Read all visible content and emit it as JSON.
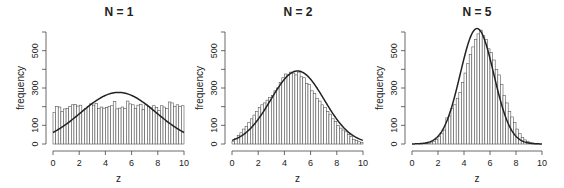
{
  "figure": {
    "ylabel": "frequency",
    "xlabel": "z",
    "colors": {
      "axis": "#444444",
      "bar_stroke": "#555555",
      "bar_fill": "#ffffff",
      "curve": "#222222"
    }
  },
  "chart_data": [
    {
      "type": "bar",
      "title": "N = 1",
      "xlabel": "z",
      "ylabel": "frequency",
      "xlim": [
        0,
        10
      ],
      "ylim": [
        0,
        600
      ],
      "xticks": [
        0,
        2,
        4,
        6,
        8,
        10
      ],
      "yticks": [
        0,
        100,
        200,
        300,
        400,
        500,
        600
      ],
      "ytick_labels": [
        "0",
        "100",
        "",
        "300",
        "",
        "500",
        ""
      ],
      "bin_width": 0.2,
      "bin_start": 0,
      "values": [
        170,
        200,
        198,
        175,
        188,
        190,
        200,
        210,
        212,
        203,
        208,
        178,
        190,
        200,
        215,
        208,
        218,
        190,
        198,
        192,
        196,
        200,
        205,
        228,
        188,
        192,
        198,
        190,
        230,
        215,
        210,
        190,
        208,
        213,
        185,
        210,
        200,
        195,
        205,
        195,
        180,
        205,
        198,
        190,
        225,
        220,
        200,
        210,
        200,
        205
      ],
      "curve": {
        "kind": "normal",
        "mean": 5,
        "sd": 2.887,
        "n": 10000
      },
      "grid": false,
      "legend": null
    },
    {
      "type": "bar",
      "title": "N = 2",
      "xlabel": "z",
      "ylabel": "frequency",
      "xlim": [
        0,
        10
      ],
      "ylim": [
        0,
        600
      ],
      "xticks": [
        0,
        2,
        4,
        6,
        8,
        10
      ],
      "yticks": [
        0,
        100,
        200,
        300,
        400,
        500,
        600
      ],
      "ytick_labels": [
        "0",
        "100",
        "",
        "300",
        "",
        "500",
        ""
      ],
      "bin_width": 0.2,
      "bin_start": 0,
      "values": [
        15,
        30,
        45,
        60,
        80,
        95,
        115,
        135,
        155,
        175,
        195,
        210,
        220,
        235,
        250,
        260,
        285,
        300,
        330,
        355,
        375,
        370,
        385,
        380,
        370,
        385,
        360,
        355,
        325,
        320,
        285,
        270,
        245,
        230,
        210,
        195,
        175,
        160,
        135,
        120,
        100,
        85,
        75,
        65,
        50,
        40,
        25,
        18,
        12,
        8
      ],
      "curve": {
        "kind": "normal",
        "mean": 5,
        "sd": 2.04,
        "n": 10000
      },
      "grid": false,
      "legend": null
    },
    {
      "type": "bar",
      "title": "N = 5",
      "xlabel": "z",
      "ylabel": "frequency",
      "xlim": [
        0,
        10
      ],
      "ylim": [
        0,
        600
      ],
      "xticks": [
        0,
        2,
        4,
        6,
        8,
        10
      ],
      "yticks": [
        0,
        100,
        200,
        300,
        400,
        500,
        600
      ],
      "ytick_labels": [
        "0",
        "100",
        "",
        "300",
        "",
        "500",
        ""
      ],
      "bin_width": 0.2,
      "bin_start": 0,
      "values": [
        0,
        0,
        0,
        1,
        2,
        3,
        5,
        10,
        15,
        25,
        40,
        55,
        75,
        140,
        150,
        190,
        210,
        245,
        275,
        330,
        380,
        430,
        480,
        520,
        560,
        590,
        610,
        580,
        560,
        510,
        490,
        450,
        400,
        370,
        320,
        260,
        220,
        175,
        145,
        115,
        80,
        55,
        35,
        22,
        14,
        8,
        5,
        3,
        1,
        0
      ],
      "curve": {
        "kind": "normal",
        "mean": 5,
        "sd": 1.29,
        "n": 10000
      },
      "grid": false,
      "legend": null
    }
  ],
  "panels_layout": [
    {
      "x0": 53,
      "x1": 184,
      "y0": 144,
      "ytop": 32,
      "title_x": 119
    },
    {
      "x0": 232,
      "x1": 363,
      "y0": 144,
      "ytop": 32,
      "title_x": 298
    },
    {
      "x0": 412,
      "x1": 542,
      "y0": 144,
      "ytop": 32,
      "title_x": 477
    }
  ]
}
